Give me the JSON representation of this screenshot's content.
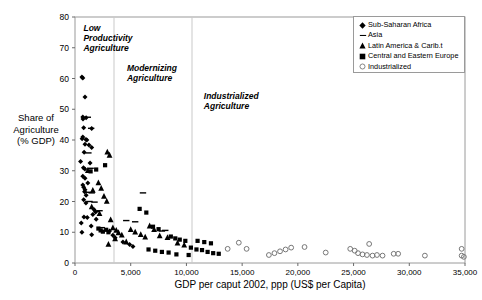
{
  "chart_data": {
    "type": "scatter",
    "title": "",
    "xlabel": "GDP per caput 2002, ppp (US$ per Capita)",
    "ylabel": "Share of Agriculture (% GDP)",
    "ylabel_lines": [
      "Share of",
      "Agriculture",
      "(% GDP)"
    ],
    "xlim": [
      0,
      35000
    ],
    "ylim": [
      0,
      80
    ],
    "xticks": [
      0,
      5000,
      10000,
      15000,
      20000,
      25000,
      30000,
      35000
    ],
    "xtick_labels": [
      "0",
      "5,000",
      "10,000",
      "15,000",
      "20,000",
      "25,000",
      "30,000",
      "35,000"
    ],
    "yticks": [
      0,
      10,
      20,
      30,
      40,
      50,
      60,
      70,
      80
    ],
    "ytick_labels": [
      "0",
      "10",
      "20",
      "30",
      "40",
      "50",
      "60",
      "70",
      "80"
    ],
    "grid": false,
    "legend_position": "top-right",
    "annotations": [
      {
        "text": "Low\nProductivity\nAgriculture",
        "x": 400,
        "y": 78
      },
      {
        "text": "Modernizing\nAgriculture",
        "x": 4300,
        "y": 65
      },
      {
        "text": "Industrialized\nAgriculture",
        "x": 11200,
        "y": 56
      }
    ],
    "divider_lines": [
      3500,
      10500
    ],
    "series": [
      {
        "name": "Sub-Saharan Africa",
        "marker": "diamond",
        "color": "#000000",
        "points": [
          [
            620,
            60.5
          ],
          [
            700,
            60.2
          ],
          [
            900,
            54.0
          ],
          [
            700,
            47.5
          ],
          [
            720,
            46.8
          ],
          [
            1000,
            47.2
          ],
          [
            780,
            44.0
          ],
          [
            1500,
            43.7
          ],
          [
            700,
            41.0
          ],
          [
            640,
            40.4
          ],
          [
            980,
            40.2
          ],
          [
            1060,
            40.0
          ],
          [
            900,
            38.6
          ],
          [
            1250,
            38.4
          ],
          [
            1500,
            37.6
          ],
          [
            820,
            36.0
          ],
          [
            500,
            33.0
          ],
          [
            1350,
            32.5
          ],
          [
            760,
            31.0
          ],
          [
            880,
            30.6
          ],
          [
            700,
            28.2
          ],
          [
            900,
            27.6
          ],
          [
            1150,
            26.0
          ],
          [
            700,
            25.4
          ],
          [
            780,
            24.6
          ],
          [
            900,
            23.8
          ],
          [
            860,
            23.2
          ],
          [
            1000,
            22.0
          ],
          [
            780,
            20.6
          ],
          [
            980,
            19.5
          ],
          [
            1700,
            17.4
          ],
          [
            1850,
            16.6
          ],
          [
            1600,
            15.8
          ],
          [
            800,
            15.0
          ],
          [
            1100,
            14.8
          ],
          [
            1900,
            14.2
          ],
          [
            560,
            13.0
          ],
          [
            1450,
            12.0
          ],
          [
            620,
            10.0
          ],
          [
            1500,
            9.2
          ],
          [
            3100,
            10.4
          ],
          [
            3400,
            9.0
          ],
          [
            3600,
            8.2
          ],
          [
            4300,
            6.8
          ],
          [
            4900,
            6.0
          ],
          [
            5200,
            5.4
          ]
        ]
      },
      {
        "name": "Asia",
        "marker": "dash",
        "color": "#000000",
        "points": [
          [
            1150,
            47.4
          ],
          [
            1450,
            43.8
          ],
          [
            1200,
            35.8
          ],
          [
            1400,
            30.8
          ],
          [
            1250,
            23.0
          ],
          [
            1500,
            22.8
          ],
          [
            1300,
            20.0
          ],
          [
            1750,
            19.8
          ],
          [
            2200,
            17.0
          ],
          [
            1950,
            16.8
          ],
          [
            2400,
            11.5
          ],
          [
            6100,
            22.8
          ],
          [
            8100,
            10.6
          ],
          [
            7800,
            10.4
          ],
          [
            4600,
            13.8
          ],
          [
            5400,
            13.4
          ]
        ]
      },
      {
        "name": "Latin America & Carib.t",
        "marker": "triangle",
        "color": "#000000",
        "points": [
          [
            1150,
            30.2
          ],
          [
            1600,
            23.8
          ],
          [
            2100,
            26.2
          ],
          [
            2350,
            24.4
          ],
          [
            2600,
            21.8
          ],
          [
            2850,
            20.2
          ],
          [
            1500,
            18.4
          ],
          [
            2200,
            16.2
          ],
          [
            3200,
            14.2
          ],
          [
            3400,
            11.6
          ],
          [
            3700,
            10.8
          ],
          [
            3900,
            10.0
          ],
          [
            4200,
            9.2
          ],
          [
            3600,
            8.0
          ],
          [
            4600,
            7.0
          ],
          [
            3000,
            6.2
          ],
          [
            5000,
            11.0
          ],
          [
            5400,
            10.2
          ],
          [
            5900,
            9.4
          ],
          [
            6300,
            8.6
          ],
          [
            6700,
            12.2
          ],
          [
            7100,
            11.0
          ],
          [
            7600,
            9.0
          ],
          [
            8300,
            8.4
          ],
          [
            2900,
            36.2
          ],
          [
            3100,
            35.2
          ],
          [
            9200,
            6.6
          ],
          [
            9800,
            6.0
          ]
        ]
      },
      {
        "name": "Central and Eastern Europe",
        "marker": "square",
        "color": "#000000",
        "points": [
          [
            2700,
            31.8
          ],
          [
            1400,
            29.8
          ],
          [
            1900,
            30.4
          ],
          [
            2100,
            11.2
          ],
          [
            2300,
            10.6
          ],
          [
            2500,
            10.2
          ],
          [
            2800,
            10.8
          ],
          [
            3000,
            10.0
          ],
          [
            5800,
            17.6
          ],
          [
            6400,
            16.4
          ],
          [
            7000,
            11.8
          ],
          [
            7500,
            11.0
          ],
          [
            8600,
            8.6
          ],
          [
            9000,
            8.0
          ],
          [
            9400,
            7.6
          ],
          [
            9900,
            7.2
          ],
          [
            10400,
            5.0
          ],
          [
            10900,
            4.4
          ],
          [
            11400,
            4.2
          ],
          [
            11900,
            3.6
          ],
          [
            12400,
            3.2
          ],
          [
            12900,
            3.0
          ],
          [
            6600,
            4.4
          ],
          [
            7200,
            4.0
          ],
          [
            7800,
            3.6
          ],
          [
            8400,
            3.4
          ],
          [
            9100,
            2.8
          ],
          [
            10200,
            2.6
          ],
          [
            11000,
            7.2
          ],
          [
            11600,
            6.8
          ],
          [
            12200,
            6.4
          ]
        ]
      },
      {
        "name": "Industrialized",
        "marker": "circle-open",
        "color": "#000000",
        "points": [
          [
            14700,
            6.6
          ],
          [
            17400,
            2.6
          ],
          [
            17900,
            3.2
          ],
          [
            18400,
            3.8
          ],
          [
            18900,
            4.4
          ],
          [
            19400,
            5.0
          ],
          [
            20600,
            5.2
          ],
          [
            22500,
            3.4
          ],
          [
            24700,
            4.6
          ],
          [
            25100,
            4.0
          ],
          [
            25400,
            3.2
          ],
          [
            25800,
            2.8
          ],
          [
            26200,
            2.6
          ],
          [
            26700,
            2.4
          ],
          [
            27100,
            2.6
          ],
          [
            27600,
            2.4
          ],
          [
            28600,
            3.0
          ],
          [
            29000,
            3.0
          ],
          [
            26400,
            6.2
          ],
          [
            31400,
            2.4
          ],
          [
            34700,
            4.6
          ],
          [
            34700,
            2.4
          ],
          [
            34900,
            2.0
          ],
          [
            13700,
            4.6
          ],
          [
            15400,
            4.6
          ]
        ]
      }
    ]
  }
}
